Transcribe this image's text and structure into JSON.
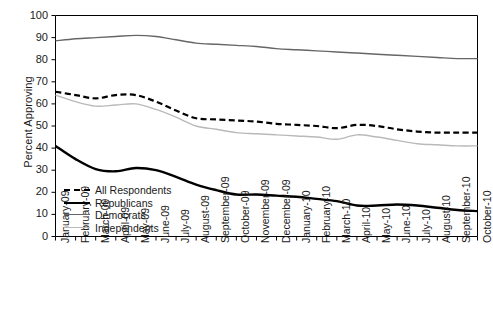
{
  "chart_data": {
    "type": "line",
    "title": "",
    "xlabel": "",
    "ylabel": "Percent Approving",
    "ylim": [
      0,
      100
    ],
    "ytick_step": 10,
    "yticks": [
      0,
      10,
      20,
      30,
      40,
      50,
      60,
      70,
      80,
      90,
      100
    ],
    "grid": false,
    "legend_position": "bottom-left inside axes",
    "categories": [
      "January-09",
      "February-09",
      "March-09",
      "April-09",
      "May-09",
      "June-09",
      "July-09",
      "August-09",
      "September-09",
      "October-09",
      "November-09",
      "December-09",
      "January-10",
      "February-10",
      "March-10",
      "April-10",
      "May-10",
      "June-10",
      "July-10",
      "August-10",
      "September-10",
      "October-10"
    ],
    "series": [
      {
        "name": "All Respondents",
        "color": "#000000",
        "style": "dashed",
        "values": [
          65.5,
          64.0,
          62.5,
          64.0,
          64.0,
          61.0,
          57.0,
          53.5,
          53.0,
          52.5,
          52.0,
          51.0,
          50.5,
          50.0,
          49.0,
          50.5,
          50.0,
          48.5,
          47.5,
          47.0,
          47.0,
          47.0
        ]
      },
      {
        "name": "Republicans",
        "color": "#000000",
        "style": "solid-thick",
        "values": [
          41.0,
          35.0,
          30.5,
          29.5,
          31.0,
          30.0,
          27.0,
          23.5,
          21.0,
          19.0,
          19.0,
          18.5,
          18.0,
          17.0,
          16.0,
          14.0,
          14.0,
          14.5,
          14.0,
          13.0,
          12.0,
          11.5
        ]
      },
      {
        "name": "Democrats",
        "color": "#666666",
        "style": "solid-medium",
        "values": [
          88.5,
          89.5,
          90.0,
          90.5,
          91.0,
          90.5,
          89.0,
          87.5,
          87.0,
          86.5,
          86.0,
          85.0,
          84.5,
          84.0,
          83.5,
          83.0,
          82.5,
          82.0,
          81.5,
          81.0,
          80.5,
          80.5
        ]
      },
      {
        "name": "Independents",
        "color": "#b9b9b9",
        "style": "solid-light",
        "values": [
          64.0,
          61.0,
          59.0,
          59.5,
          60.0,
          57.5,
          54.0,
          50.0,
          48.5,
          47.0,
          46.5,
          46.0,
          45.5,
          45.0,
          44.0,
          46.0,
          45.0,
          43.5,
          42.0,
          41.5,
          41.0,
          41.0
        ]
      }
    ]
  },
  "legend": {
    "items": [
      {
        "label": "All Respondents"
      },
      {
        "label": "Republicans"
      },
      {
        "label": "Democrats"
      },
      {
        "label": "Independents"
      }
    ]
  }
}
